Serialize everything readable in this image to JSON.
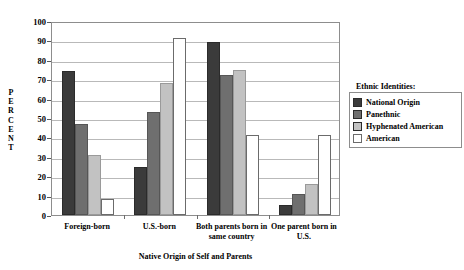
{
  "chart_data": {
    "type": "bar",
    "title": "",
    "xlabel": "Native Origin of Self and Parents",
    "ylabel": "PERCENT",
    "ylim": [
      0,
      100
    ],
    "ytick_step": 10,
    "yticks": [
      0,
      10,
      20,
      30,
      40,
      50,
      60,
      70,
      80,
      90,
      100
    ],
    "grid": true,
    "legend_position": "right",
    "legend_title": "Ethnic Identities:",
    "categories": [
      "Foreign-born",
      "U.S.-born",
      "Both parents born in same country",
      "One parent born in U.S."
    ],
    "category_lines": [
      [
        "Foreign-born"
      ],
      [
        "U.S.-born"
      ],
      [
        "Both parents born in",
        "same country"
      ],
      [
        "One parent born in",
        "U.S."
      ]
    ],
    "series": [
      {
        "name": "National Origin",
        "color": "#3b3b3b",
        "values": [
          74,
          25,
          89,
          5
        ]
      },
      {
        "name": "Panethnic",
        "color": "#6f6f6f",
        "values": [
          47,
          53,
          72,
          11
        ]
      },
      {
        "name": "Hyphenated American",
        "color": "#c2c2c2",
        "values": [
          31,
          68,
          75,
          16
        ]
      },
      {
        "name": "American",
        "color": "#ffffff",
        "values": [
          8,
          91,
          41,
          41
        ]
      }
    ]
  }
}
